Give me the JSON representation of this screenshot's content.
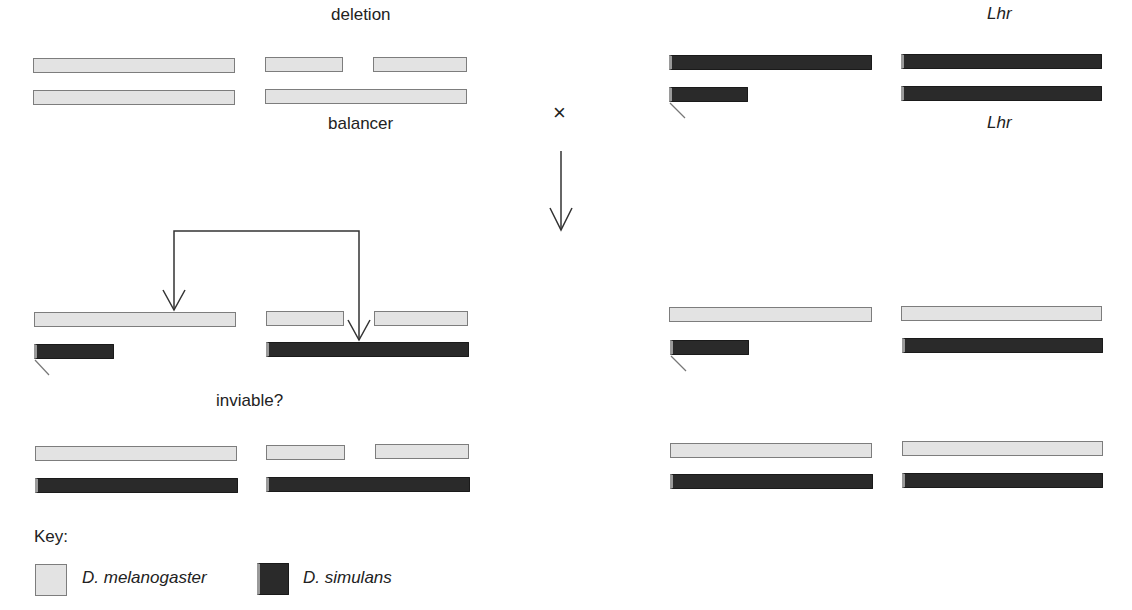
{
  "labels": {
    "deletion": "deletion",
    "balancer": "balancer",
    "lhr_top": "Lhr",
    "lhr_bottom": "Lhr",
    "cross_symbol": "×",
    "inviable": "inviable?"
  },
  "key": {
    "title": "Key:",
    "items": [
      {
        "label": "D. melanogaster",
        "color": "#e3e3e3"
      },
      {
        "label": "D. simulans",
        "color": "#2a2a2a"
      }
    ]
  },
  "colors": {
    "melanogaster": "#e3e3e3",
    "simulans": "#2a2a2a",
    "outline": "#7d7d7d",
    "line": "#333333"
  },
  "panels": [
    {
      "id": "parent-melanogaster",
      "description": "D. melanogaster female: X + deletion/balancer"
    },
    {
      "id": "parent-simulans",
      "description": "D. simulans male: X/Y + Lhr/Lhr"
    },
    {
      "id": "offspring-left-top",
      "description": "Deletion over Lhr hybrid (arrows)"
    },
    {
      "id": "offspring-left-bottom",
      "description": "Deletion hybrid female"
    },
    {
      "id": "offspring-right-top",
      "description": "Balancer hybrid male"
    },
    {
      "id": "offspring-right-bottom",
      "description": "Balancer hybrid female"
    }
  ]
}
